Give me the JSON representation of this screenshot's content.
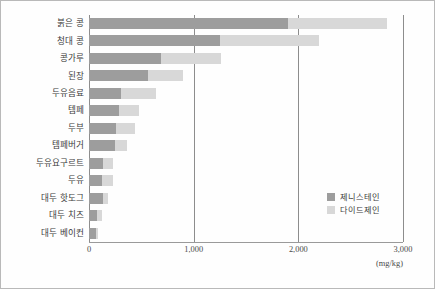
{
  "chart_data": {
    "type": "bar",
    "orientation": "horizontal",
    "stacked": true,
    "title": "",
    "xlabel": "(mg/kg)",
    "ylabel": "",
    "xlim": [
      0,
      3000
    ],
    "xticks": [
      0,
      1000,
      2000,
      3000
    ],
    "xtick_labels": [
      "0",
      "1,000",
      "2,000",
      "3,000"
    ],
    "grid": "vertical",
    "legend_position": "inside-right-lower",
    "categories": [
      "붉은 콩",
      "청대 콩",
      "콩가루",
      "된장",
      "두유음료",
      "템페",
      "두부",
      "템페버거",
      "두유요구르트",
      "두유",
      "대두 핫도그",
      "대두 치즈",
      "대두 베이컨"
    ],
    "series": [
      {
        "name": "제니스테인",
        "color": "#9d9d9d",
        "values": [
          1900,
          1250,
          690,
          560,
          310,
          290,
          260,
          250,
          130,
          120,
          130,
          75,
          70
        ]
      },
      {
        "name": "다이드제인",
        "color": "#d8d8d8",
        "values": [
          950,
          950,
          570,
          340,
          330,
          190,
          180,
          110,
          100,
          110,
          50,
          45,
          20
        ]
      }
    ],
    "totals": [
      2850,
      2200,
      1260,
      900,
      640,
      480,
      440,
      360,
      230,
      230,
      180,
      120,
      90
    ]
  },
  "legend": {
    "items": [
      {
        "label": "제니스테인",
        "color": "#9d9d9d"
      },
      {
        "label": "다이드제인",
        "color": "#d8d8d8"
      }
    ]
  },
  "axis": {
    "unit": "(mg/kg)"
  }
}
